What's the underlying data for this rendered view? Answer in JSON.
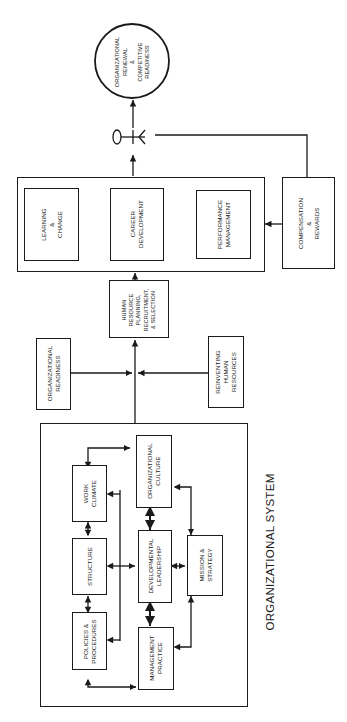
{
  "diagram": {
    "orientation": "rotated -90deg (reads bottom to top)",
    "outcome": {
      "label": "ORGANIZATIONAL\nRENEWAL\n&\nCOMPETITIVE\nREADINESS"
    },
    "hr_outcomes_group": {
      "items": [
        {
          "label": "LEARNING\n&\nCHANGE"
        },
        {
          "label": "CAREER\nDEVELOPMENT"
        },
        {
          "label": "PERFORMANCE\nMANAGEMENT"
        }
      ]
    },
    "compensation": {
      "label": "COMPENSATION\n&\nREWARDS"
    },
    "hr_planning": {
      "label": "HUMAN\nRESOURCE\nPLANNING,\nRECRUITMENT,\n& SELECTION"
    },
    "org_readiness": {
      "label": "ORGANIZATIONAL\nREADINESS"
    },
    "reinventing_hr": {
      "label": "REINVENTING\nHUMAN\nRESOURCES"
    },
    "org_system": {
      "title": "ORGANIZATIONAL SYSTEM",
      "components": {
        "work_climate": "WORK\nCLIMATE",
        "structure": "STRUCTURE",
        "policies": "POLICIES &\nPROCEDURES",
        "org_culture": "ORGANIZATIONAL\nCULTURE",
        "dev_leadership": "DEVELOPMENTAL\nLEADERSHIP",
        "mgmt_practice": "MANAGEMENT\nPRACTICE",
        "mission": "MISSION &\nSTRATEGY"
      }
    },
    "colors": {
      "line": "#1a1a1a",
      "background": "#ffffff"
    }
  }
}
